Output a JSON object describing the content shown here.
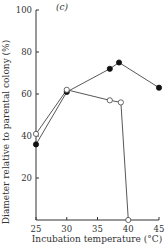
{
  "chart_data": {
    "type": "line",
    "panel_label": "(c)",
    "title": "",
    "xlabel": "Incubation temperature (°C)",
    "ylabel": "Diameter relative to parental colony (%)",
    "xlim": [
      25,
      45
    ],
    "ylim": [
      0,
      100
    ],
    "xticks": [
      25,
      30,
      35,
      40,
      45
    ],
    "yticks": [
      20,
      40,
      60,
      80,
      100
    ],
    "grid": false,
    "legend": null,
    "series": [
      {
        "name": "filled circles",
        "marker": "filled-circle",
        "x": [
          25,
          30,
          37,
          38.5,
          45
        ],
        "values": [
          36,
          61,
          72,
          75,
          63
        ]
      },
      {
        "name": "open circles",
        "marker": "open-circle",
        "x": [
          25,
          30,
          37,
          38.8,
          40
        ],
        "values": [
          41,
          62,
          57,
          56,
          0
        ]
      }
    ]
  },
  "colors": {
    "axis": "#333333",
    "line": "#444444",
    "filled_marker": "#111111",
    "open_marker_fill": "#ffffff"
  }
}
